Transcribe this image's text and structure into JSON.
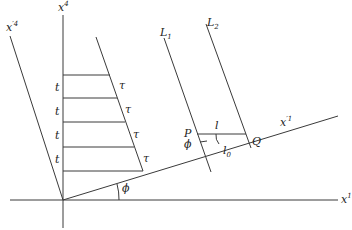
{
  "diagram": {
    "axes": {
      "x1": {
        "label": "x",
        "sup": "1"
      },
      "x4": {
        "label": "x",
        "sup": "4"
      },
      "x1_prime": {
        "label": "x",
        "sup": "′1"
      },
      "x4_prime": {
        "label": "x",
        "sup": "′4"
      }
    },
    "lines": {
      "L1": {
        "label": "L",
        "sub": "1"
      },
      "L2": {
        "label": "L",
        "sub": "2"
      }
    },
    "points": {
      "P": "P",
      "Q": "Q"
    },
    "lengths": {
      "l": "l",
      "l0": {
        "label": "l",
        "sub": "0"
      }
    },
    "angles": {
      "phi_origin": "ϕ",
      "phi_P": "ϕ"
    },
    "ladder": {
      "t_labels": [
        "t",
        "t",
        "t",
        "t"
      ],
      "tau_labels": [
        "τ",
        "τ",
        "τ",
        "τ"
      ]
    }
  }
}
